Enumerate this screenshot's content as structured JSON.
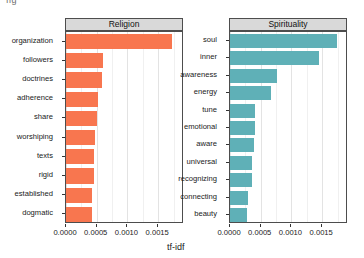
{
  "figure": {
    "corner_mark": "fig",
    "xlabel": "tf-idf",
    "background": "#ffffff",
    "strip_background": "#d9d9d9",
    "panel_border": "#4d4d4d"
  },
  "axis": {
    "tick_labels": [
      "0.0000",
      "0.0005",
      "0.0010",
      "0.0015"
    ],
    "tick_values": [
      0.0,
      0.0005,
      0.001,
      0.0015
    ],
    "xlim": [
      0.0,
      0.00192
    ],
    "minor_tick_values": [
      0.00025,
      0.00075,
      0.00125,
      0.00175
    ]
  },
  "chart_data": {
    "type": "bar",
    "orientation": "horizontal",
    "title": "",
    "subtitle": "",
    "xlabel": "tf-idf",
    "ylabel": "",
    "xlim": [
      0.0,
      0.00192
    ],
    "grid": true,
    "legend": "none",
    "facet_layout": "1 row x 2 columns",
    "facets": [
      {
        "name": "Religion",
        "color": "#f8764f",
        "categories": [
          "organization",
          "followers",
          "doctrines",
          "adherence",
          "share",
          "worshiping",
          "texts",
          "rigid",
          "established",
          "dogmatic"
        ],
        "values": [
          0.00173,
          0.00061,
          0.00058,
          0.00052,
          0.00051,
          0.00047,
          0.00046,
          0.00045,
          0.00043,
          0.00043
        ]
      },
      {
        "name": "Spirituality",
        "color": "#5fb0b7",
        "categories": [
          "soul",
          "inner",
          "awareness",
          "energy",
          "tune",
          "emotional",
          "aware",
          "universal",
          "recognizing",
          "connecting",
          "beauty"
        ],
        "values": [
          0.00174,
          0.00144,
          0.00076,
          0.00067,
          0.00041,
          0.0004,
          0.00039,
          0.00036,
          0.00035,
          0.00029,
          0.00028
        ]
      }
    ]
  }
}
